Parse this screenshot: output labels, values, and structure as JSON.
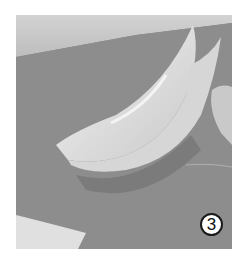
{
  "image": {
    "subject": "carved white vegetable crescent on grey cutting board",
    "colors": {
      "board": "#8c8c8c",
      "board_light": "#b5b5b5",
      "vegetable": "#e4e4e4",
      "vegetable_shadow": "#c8c8c8",
      "background_top": "#d8d8d8"
    }
  },
  "step_badge": {
    "label": "3"
  }
}
